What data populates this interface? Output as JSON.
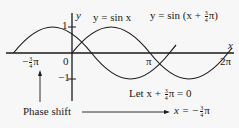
{
  "diagram": {
    "axes": {
      "x_label": "x",
      "y_label": "y",
      "origin_label": "0",
      "y_tick_pos": "1",
      "y_tick_neg": "−1",
      "x_ticks": {
        "neg_shift_sign": "−",
        "neg_shift_num": "3",
        "neg_shift_den": "4",
        "neg_shift_pi": "π",
        "pi": "π",
        "two_pi": "2π"
      }
    },
    "curves": {
      "sin_label": "y = sin x",
      "shifted_prefix": "y = sin (x + ",
      "shifted_num": "3",
      "shifted_den": "4",
      "shifted_suffix": "π)"
    },
    "annotations": {
      "let_prefix": "Let x + ",
      "let_num": "3",
      "let_den": "4",
      "let_suffix": "π = 0",
      "phase_shift": "Phase shift",
      "result_prefix": "x = −",
      "result_num": "3",
      "result_den": "4",
      "result_suffix": "π"
    },
    "colors": {
      "ink": "#1a1a1a",
      "background": "#f7f7f7"
    }
  }
}
